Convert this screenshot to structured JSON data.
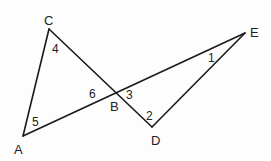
{
  "diagram": {
    "points": {
      "A": {
        "x": 23,
        "y": 136,
        "label": "A"
      },
      "B": {
        "x": 116,
        "y": 92,
        "label": "B"
      },
      "C": {
        "x": 49,
        "y": 29,
        "label": "C"
      },
      "D": {
        "x": 152,
        "y": 127,
        "label": "D"
      },
      "E": {
        "x": 245,
        "y": 33,
        "label": "E"
      }
    },
    "segments": [
      [
        "C",
        "A"
      ],
      [
        "A",
        "E"
      ],
      [
        "C",
        "D"
      ],
      [
        "D",
        "E"
      ]
    ],
    "angle_labels": [
      {
        "id": "1",
        "text": "1",
        "at": "E",
        "x": 208,
        "y": 62
      },
      {
        "id": "2",
        "text": "2",
        "at": "D",
        "x": 146,
        "y": 120
      },
      {
        "id": "3",
        "text": "3",
        "at": "B",
        "x": 126,
        "y": 99
      },
      {
        "id": "4",
        "text": "4",
        "at": "C",
        "x": 52,
        "y": 52
      },
      {
        "id": "5",
        "text": "5",
        "at": "A",
        "x": 32,
        "y": 126
      },
      {
        "id": "6",
        "text": "6",
        "at": "B",
        "x": 89,
        "y": 98
      }
    ],
    "vertex_labels": [
      {
        "text": "A",
        "x": 14,
        "y": 154
      },
      {
        "text": "B",
        "x": 110,
        "y": 111
      },
      {
        "text": "C",
        "x": 44,
        "y": 25
      },
      {
        "text": "D",
        "x": 151,
        "y": 145
      },
      {
        "text": "E",
        "x": 250,
        "y": 37
      }
    ]
  }
}
